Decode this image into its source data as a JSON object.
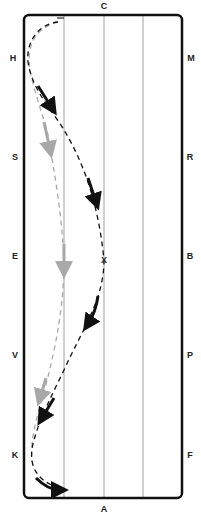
{
  "diagram": {
    "type": "dressage-arena",
    "arena": {
      "x": 24,
      "y": 15,
      "width": 158,
      "height": 483,
      "border_color": "#111111",
      "quarter_line_color": "#a0a0a0"
    },
    "letters": [
      {
        "id": "C",
        "label": "C",
        "x": 104,
        "y": 9
      },
      {
        "id": "H",
        "label": "H",
        "x": 13,
        "y": 61
      },
      {
        "id": "M",
        "label": "M",
        "x": 191,
        "y": 61
      },
      {
        "id": "S",
        "label": "S",
        "x": 15,
        "y": 160
      },
      {
        "id": "R",
        "label": "R",
        "x": 190,
        "y": 160
      },
      {
        "id": "E",
        "label": "E",
        "x": 15,
        "y": 259
      },
      {
        "id": "B",
        "label": "B",
        "x": 190,
        "y": 259
      },
      {
        "id": "V",
        "label": "V",
        "x": 15,
        "y": 358
      },
      {
        "id": "P",
        "label": "P",
        "x": 190,
        "y": 358
      },
      {
        "id": "K",
        "label": "K",
        "x": 15,
        "y": 458
      },
      {
        "id": "F",
        "label": "F",
        "x": 190,
        "y": 458
      },
      {
        "id": "A",
        "label": "A",
        "x": 104,
        "y": 512
      }
    ],
    "center_marker": {
      "label": "X",
      "x": 104,
      "y": 260
    },
    "paths": [
      {
        "name": "black-serpentine-path",
        "color": "#111111"
      },
      {
        "name": "grey-shallow-path",
        "color": "#a8a8a8"
      }
    ]
  }
}
